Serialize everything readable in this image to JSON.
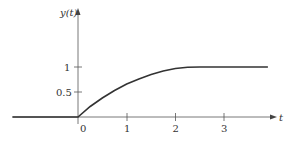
{
  "chart_data": {
    "type": "line",
    "title": "",
    "xlabel": "t",
    "ylabel": "y(t)",
    "x_ticks": [
      "0",
      "1",
      "2",
      "3"
    ],
    "y_ticks": [
      "0.5",
      "1"
    ],
    "xlim": [
      -1.35,
      4.0
    ],
    "ylim": [
      0,
      2.2
    ],
    "grid": false,
    "legend": null,
    "series": [
      {
        "name": "y(t)",
        "x": [
          -1.35,
          0,
          0.25,
          0.5,
          0.75,
          1.0,
          1.25,
          1.5,
          1.75,
          2.0,
          2.25,
          2.5,
          3.0,
          3.5,
          3.9
        ],
        "y": [
          0,
          0,
          0.21,
          0.38,
          0.53,
          0.66,
          0.76,
          0.85,
          0.92,
          0.97,
          0.995,
          1.0,
          1.0,
          1.0,
          1.0
        ]
      }
    ],
    "colors": {
      "curve": "#333333",
      "axis": "#555555"
    }
  },
  "labels": {
    "y_axis": "y(t)",
    "x_axis": "t",
    "x0": "0",
    "x1": "1",
    "x2": "2",
    "x3": "3",
    "y05": "0.5",
    "y1": "1"
  }
}
